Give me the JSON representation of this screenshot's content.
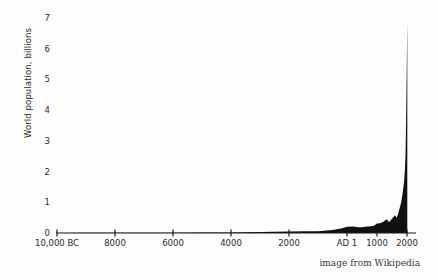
{
  "chart_data": {
    "type": "area",
    "title": "",
    "xlabel": "",
    "ylabel": "World population, billions",
    "credit": "image from Wikipedia",
    "grid": false,
    "legend": false,
    "ylim": [
      0,
      7
    ],
    "yticks": [
      0,
      1,
      2,
      3,
      4,
      5,
      6,
      7
    ],
    "ytick_labels": [
      "0",
      "1",
      "2",
      "3",
      "4",
      "5",
      "6",
      "7"
    ],
    "xlim": [
      -10000,
      2000
    ],
    "xticks": [
      -10000,
      -8000,
      -6000,
      -4000,
      -2000,
      1,
      1000,
      2000
    ],
    "xtick_labels": [
      "10,000 BC",
      "8000",
      "6000",
      "4000",
      "2000",
      "AD 1",
      "1000",
      "2000"
    ],
    "xtick_positions_px": [
      57,
      115,
      173,
      231,
      289,
      347,
      377,
      407
    ],
    "axis_color": "#1a1a1a",
    "series_color": "#111111",
    "background_color": "#fdfdfd",
    "series": [
      {
        "name": "World population",
        "x": [
          -10000,
          -9000,
          -8000,
          -7000,
          -6000,
          -5000,
          -4000,
          -3000,
          -2000,
          -1500,
          -1000,
          -800,
          -500,
          -400,
          -200,
          1,
          200,
          400,
          500,
          600,
          700,
          800,
          900,
          1000,
          1100,
          1200,
          1250,
          1300,
          1340,
          1400,
          1500,
          1600,
          1650,
          1700,
          1750,
          1800,
          1850,
          1900,
          1927,
          1950,
          1960,
          1974,
          1987,
          1999,
          2000,
          2010
        ],
        "values": [
          0.004,
          0.005,
          0.005,
          0.007,
          0.01,
          0.015,
          0.02,
          0.03,
          0.05,
          0.055,
          0.06,
          0.07,
          0.1,
          0.115,
          0.15,
          0.2,
          0.21,
          0.19,
          0.19,
          0.2,
          0.21,
          0.22,
          0.24,
          0.31,
          0.32,
          0.36,
          0.4,
          0.43,
          0.44,
          0.35,
          0.46,
          0.58,
          0.5,
          0.6,
          0.79,
          0.98,
          1.26,
          1.65,
          2.0,
          2.52,
          3.02,
          4.0,
          5.0,
          6.0,
          6.12,
          6.9
        ]
      }
    ],
    "annotations": [
      {
        "label": "hockey-stick growth after 1800"
      },
      {
        "label": "Black Death dip c. 1350"
      }
    ]
  },
  "axis": {
    "ylabel": "World population, billions",
    "credit": "image from Wikipedia"
  }
}
